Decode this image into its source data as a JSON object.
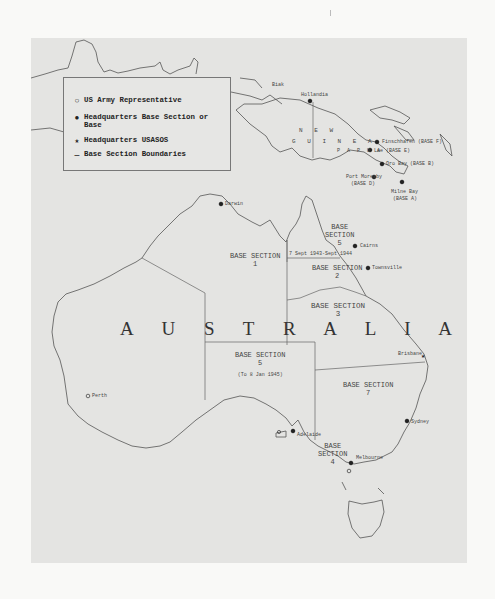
{
  "legend": {
    "items": [
      {
        "symbol": "○",
        "icon": "open-circle-icon",
        "label": "US Army Representative"
      },
      {
        "symbol": "●",
        "icon": "filled-circle-icon",
        "label": "Headquarters Base Section or Base"
      },
      {
        "symbol": "★",
        "icon": "star-icon",
        "label": "Headquarters USASOS"
      },
      {
        "symbol": "—",
        "icon": "line-icon",
        "label": "Base Section Boundaries"
      }
    ]
  },
  "regions": {
    "australia": "A U S T R A L I A",
    "new_guinea_1": "N E W",
    "new_guinea_2": "G U I N E A",
    "papua": "P A P U A"
  },
  "sections": [
    {
      "title": "BASE SECTION",
      "number": "1"
    },
    {
      "title": "BASE SECTION",
      "number": "2"
    },
    {
      "title": "BASE SECTION",
      "number": "3"
    },
    {
      "title": "BASE SECTION",
      "number": "4"
    },
    {
      "title": "BASE SECTION",
      "number": "5",
      "note": "(To 8 Jan 1945)"
    },
    {
      "title": "BASE SECTION",
      "number": "5",
      "note": "7 Sept 1943-Sept 1944"
    },
    {
      "title": "BASE SECTION",
      "number": "7"
    }
  ],
  "places": {
    "biak": "Biak",
    "hollandia": "Hollandia",
    "finschhafen": "Finschhafen (BASE F)",
    "lae": "Lae (BASE E)",
    "oro_bay": "Oro Bay (BASE B)",
    "port_moresby_1": "Port Moresby",
    "port_moresby_2": "(BASE D)",
    "milne_bay_1": "Milne Bay",
    "milne_bay_2": "(BASE A)",
    "darwin": "Darwin",
    "cairns": "Cairns",
    "townsville": "Townsville",
    "brisbane": "Brisbane",
    "sydney": "Sydney",
    "melbourne": "Melbourne",
    "adelaide": "Adelaide",
    "perth": "Perth"
  }
}
